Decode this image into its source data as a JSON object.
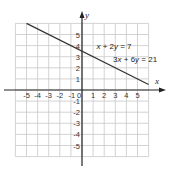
{
  "chart_data": {
    "type": "line",
    "title": "",
    "xlabel": "x",
    "ylabel": "y",
    "xlim": [
      -6,
      6
    ],
    "ylim": [
      -6,
      6
    ],
    "grid": true,
    "x_ticks": [
      -5,
      -4,
      -3,
      -2,
      -1,
      0,
      1,
      2,
      3,
      4,
      5
    ],
    "y_ticks": [
      5,
      4,
      3,
      2,
      1,
      -1,
      -2,
      -3,
      -4,
      -5
    ],
    "x_tick_labels": [
      "-5",
      "-4",
      "-3",
      "-2",
      "-1",
      "0",
      "1",
      "2",
      "3",
      "4",
      "5"
    ],
    "y_tick_labels": [
      "5",
      "4",
      "3",
      "2",
      "1",
      "-1",
      "-2",
      "-3",
      "-4",
      "-5"
    ],
    "series": [
      {
        "name": "x + 2y = 7 / 3x + 6y = 21",
        "x": [
          -5,
          6
        ],
        "y": [
          6,
          0.5
        ]
      }
    ],
    "annotations": [
      {
        "text": "x + 2y = 7",
        "parts": [
          [
            "x",
            true
          ],
          [
            " + 2",
            false
          ],
          [
            "y",
            true
          ],
          [
            " = 7",
            false
          ]
        ],
        "at": [
          1.3,
          3.7
        ]
      },
      {
        "text": "3x + 6y = 21",
        "parts": [
          [
            "3",
            false
          ],
          [
            "x",
            true
          ],
          [
            " + 6",
            false
          ],
          [
            "y",
            true
          ],
          [
            " = 21",
            false
          ]
        ],
        "at": [
          2.8,
          2.5
        ]
      }
    ],
    "colors": {
      "grid": "#c8c8c8",
      "axis": "#222222",
      "line": "#333333"
    }
  }
}
